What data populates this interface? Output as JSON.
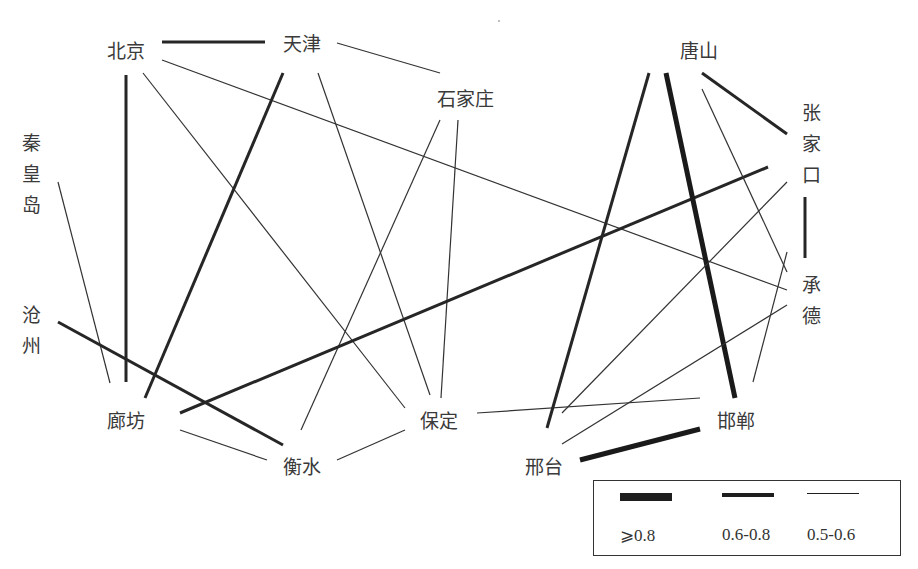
{
  "figure": {
    "type": "network-diagram"
  },
  "nodes": [
    {
      "id": "beijing",
      "label": "北京",
      "x": 107,
      "y": 42,
      "orientation": "horizontal"
    },
    {
      "id": "tianjin",
      "label": "天津",
      "x": 283,
      "y": 35,
      "orientation": "horizontal"
    },
    {
      "id": "shijiazhuang",
      "label": "石家庄",
      "x": 437,
      "y": 90,
      "orientation": "horizontal"
    },
    {
      "id": "tangshan",
      "label": "唐山",
      "x": 680,
      "y": 42,
      "orientation": "horizontal"
    },
    {
      "id": "qinhuangdao",
      "label": "秦皇岛",
      "x": 20,
      "y": 133,
      "orientation": "vertical"
    },
    {
      "id": "zhangjiakou",
      "label": "张家口",
      "x": 800,
      "y": 103,
      "orientation": "vertical"
    },
    {
      "id": "cangzhou",
      "label": "沧州",
      "x": 20,
      "y": 305,
      "orientation": "vertical"
    },
    {
      "id": "chengde",
      "label": "承德",
      "x": 800,
      "y": 275,
      "orientation": "vertical"
    },
    {
      "id": "langfang",
      "label": "廊坊",
      "x": 107,
      "y": 412,
      "orientation": "horizontal"
    },
    {
      "id": "baoding",
      "label": "保定",
      "x": 420,
      "y": 412,
      "orientation": "horizontal"
    },
    {
      "id": "handan",
      "label": "邯郸",
      "x": 717,
      "y": 412,
      "orientation": "horizontal"
    },
    {
      "id": "hengshui",
      "label": "衡水",
      "x": 283,
      "y": 458,
      "orientation": "horizontal"
    },
    {
      "id": "xingtai",
      "label": "邢台",
      "x": 525,
      "y": 458,
      "orientation": "horizontal"
    }
  ],
  "edges": [
    {
      "from": "北京",
      "to": "天津",
      "strength": "0.6-0.8",
      "x1": 162,
      "y1": 42,
      "x2": 265,
      "y2": 42
    },
    {
      "from": "北京",
      "to": "廊坊",
      "strength": "0.6-0.8",
      "x1": 126,
      "y1": 75,
      "x2": 126,
      "y2": 382
    },
    {
      "from": "北京",
      "to": "保定",
      "strength": "0.5-0.6",
      "x1": 143,
      "y1": 73,
      "x2": 405,
      "y2": 408
    },
    {
      "from": "北京",
      "to": "承德",
      "strength": "0.5-0.6",
      "x1": 162,
      "y1": 60,
      "x2": 787,
      "y2": 290
    },
    {
      "from": "天津",
      "to": "石家庄",
      "strength": "0.5-0.6",
      "x1": 337,
      "y1": 43,
      "x2": 440,
      "y2": 73
    },
    {
      "from": "天津",
      "to": "廊坊",
      "strength": "0.6-0.8",
      "x1": 283,
      "y1": 73,
      "x2": 145,
      "y2": 398
    },
    {
      "from": "天津",
      "to": "保定",
      "strength": "0.5-0.6",
      "x1": 318,
      "y1": 73,
      "x2": 430,
      "y2": 395
    },
    {
      "from": "石家庄",
      "to": "衡水",
      "strength": "0.5-0.6",
      "x1": 440,
      "y1": 120,
      "x2": 301,
      "y2": 430
    },
    {
      "from": "石家庄",
      "to": "保定",
      "strength": "0.5-0.6",
      "x1": 458,
      "y1": 120,
      "x2": 441,
      "y2": 398
    },
    {
      "from": "秦皇岛",
      "to": "廊坊",
      "strength": "0.5-0.6",
      "x1": 58,
      "y1": 182,
      "x2": 110,
      "y2": 383
    },
    {
      "from": "沧州",
      "to": "衡水",
      "strength": "0.6-0.8",
      "x1": 58,
      "y1": 322,
      "x2": 283,
      "y2": 445
    },
    {
      "from": "廊坊",
      "to": "张家口",
      "strength": "0.6-0.8",
      "x1": 180,
      "y1": 413,
      "x2": 768,
      "y2": 167
    },
    {
      "from": "廊坊",
      "to": "衡水",
      "strength": "0.5-0.6",
      "x1": 180,
      "y1": 430,
      "x2": 267,
      "y2": 460
    },
    {
      "from": "衡水",
      "to": "保定",
      "strength": "0.5-0.6",
      "x1": 337,
      "y1": 460,
      "x2": 405,
      "y2": 430
    },
    {
      "from": "保定",
      "to": "邯郸",
      "strength": "0.5-0.6",
      "x1": 477,
      "y1": 413,
      "x2": 700,
      "y2": 398
    },
    {
      "from": "唐山",
      "to": "邢台",
      "strength": "0.6-0.8",
      "x1": 649,
      "y1": 73,
      "x2": 547,
      "y2": 428
    },
    {
      "from": "唐山",
      "to": "邯郸",
      "strength": ">=0.8",
      "x1": 666,
      "y1": 73,
      "x2": 735,
      "y2": 398
    },
    {
      "from": "唐山",
      "to": "张家口",
      "strength": "0.6-0.8",
      "x1": 702,
      "y1": 73,
      "x2": 787,
      "y2": 134
    },
    {
      "from": "唐山",
      "to": "承德",
      "strength": "0.5-0.6",
      "x1": 702,
      "y1": 89,
      "x2": 787,
      "y2": 272
    },
    {
      "from": "张家口",
      "to": "承德",
      "strength": "0.6-0.8",
      "x1": 805,
      "y1": 197,
      "x2": 805,
      "y2": 258
    },
    {
      "from": "张家口",
      "to": "邢台",
      "strength": "0.5-0.6",
      "x1": 787,
      "y1": 182,
      "x2": 562,
      "y2": 413
    },
    {
      "from": "承德",
      "to": "邢台",
      "strength": "0.5-0.6",
      "x1": 787,
      "y1": 305,
      "x2": 562,
      "y2": 444
    },
    {
      "from": "承德",
      "to": "邯郸",
      "strength": "0.5-0.6",
      "x1": 787,
      "y1": 252,
      "x2": 753,
      "y2": 382
    },
    {
      "from": "邢台",
      "to": "邯郸",
      "strength": ">=0.8",
      "x1": 580,
      "y1": 460,
      "x2": 700,
      "y2": 429
    }
  ],
  "strength_styles": {
    ">=0.8": {
      "width": 5,
      "color": "#1a1a1a"
    },
    "0.6-0.8": {
      "width": 3,
      "color": "#262626"
    },
    "0.5-0.6": {
      "width": 1.2,
      "color": "#333333"
    }
  },
  "legend": {
    "items": [
      {
        "key": ">=0.8",
        "label": "⩾0.8",
        "swatch_width": 5
      },
      {
        "key": "0.6-0.8",
        "label": "0.6-0.8",
        "swatch_width": 3
      },
      {
        "key": "0.5-0.6",
        "label": "0.5-0.6",
        "swatch_width": 1.2
      }
    ]
  }
}
